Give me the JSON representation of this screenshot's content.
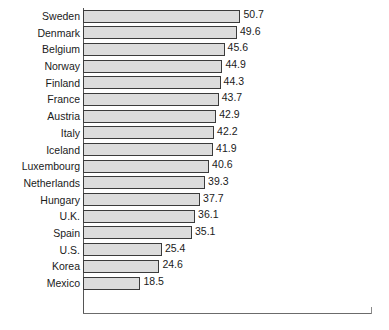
{
  "chart_data": {
    "type": "bar",
    "orientation": "horizontal",
    "title": "",
    "subtitle": "",
    "xlabel": "",
    "ylabel": "",
    "xlim": [
      0,
      93
    ],
    "grid": false,
    "legend": null,
    "categories": [
      "Sweden",
      "Denmark",
      "Belgium",
      "Norway",
      "Finland",
      "France",
      "Austria",
      "Italy",
      "Iceland",
      "Luxembourg",
      "Netherlands",
      "Hungary",
      "U.K.",
      "Spain",
      "U.S.",
      "Korea",
      "Mexico"
    ],
    "values": [
      50.7,
      49.6,
      45.6,
      44.9,
      44.3,
      43.7,
      42.9,
      42.2,
      41.9,
      40.6,
      39.3,
      37.7,
      36.1,
      35.1,
      25.4,
      24.6,
      18.5
    ],
    "value_labels": [
      "50.7",
      "49.6",
      "45.6",
      "44.9",
      "44.3",
      "43.7",
      "42.9",
      "42.2",
      "41.9",
      "40.6",
      "39.3",
      "37.7",
      "36.1",
      "35.1",
      "25.4",
      "24.6",
      "18.5"
    ]
  },
  "style": {
    "bar_fill": "#dcdcdc",
    "bar_stroke": "#3b3b3b",
    "axis_color": "#555555",
    "text_color": "#1a1a1a",
    "background": "#ffffff"
  }
}
